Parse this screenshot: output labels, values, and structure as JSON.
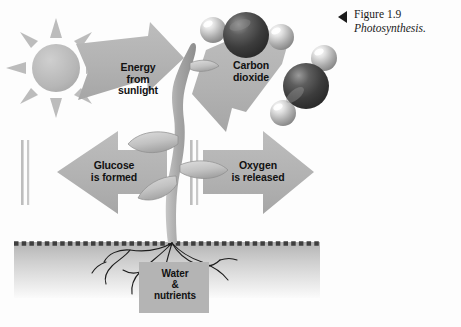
{
  "figure": {
    "caption_marker": "left-triangle-marker",
    "caption_number": "Figure 1.9",
    "caption_title": "Photosynthesis.",
    "background_color": "#fdfdfd"
  },
  "diagram": {
    "title": "Photosynthesis",
    "ground_line_color": "#4a4a4a",
    "soil_band_top_color": "#b9b9b9",
    "soil_band_bottom_color": "#f2f2f2",
    "arrow_fill": "#b3b3b3",
    "plant_fill": "#a9a9a9",
    "text_color": "#111111",
    "labels": {
      "energy": "Energy\nfrom\nsunlight",
      "carbon_dioxide": "Carbon\ndioxide",
      "glucose": "Glucose\nis formed",
      "oxygen": "Oxygen\nis released",
      "water": "Water\n&\nnutrients"
    },
    "elements": [
      {
        "name": "sun",
        "type": "icon",
        "rays": 8
      },
      {
        "name": "energy-from-sunlight-arrow",
        "type": "arrow",
        "direction": "right"
      },
      {
        "name": "carbon-dioxide-arrow",
        "type": "arrow",
        "direction": "left"
      },
      {
        "name": "glucose-arrow",
        "type": "arrow",
        "direction": "left"
      },
      {
        "name": "oxygen-arrow",
        "type": "arrow",
        "direction": "right"
      },
      {
        "name": "plant",
        "type": "illustration"
      },
      {
        "name": "roots",
        "type": "illustration"
      },
      {
        "name": "soil-band",
        "type": "illustration"
      },
      {
        "name": "carbon-dioxide-molecule-1",
        "type": "molecule",
        "atoms": [
          "oxygen",
          "carbon",
          "oxygen"
        ]
      },
      {
        "name": "carbon-dioxide-molecule-2",
        "type": "molecule",
        "atoms": [
          "oxygen",
          "carbon",
          "oxygen"
        ]
      },
      {
        "name": "water-nutrients-box",
        "type": "callout"
      }
    ]
  }
}
